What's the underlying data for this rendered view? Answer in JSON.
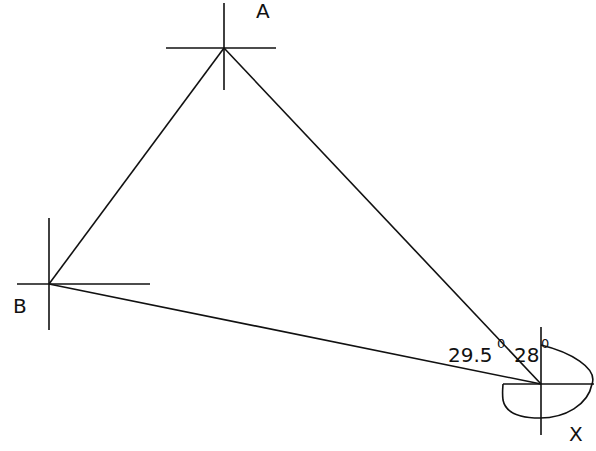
{
  "diagram": {
    "type": "bearing-triangle",
    "points": {
      "A": {
        "label": "A",
        "x": 224,
        "y": 48
      },
      "B": {
        "label": "B",
        "x": 49,
        "y": 284
      },
      "X": {
        "label": "X",
        "x": 541,
        "y": 384
      }
    },
    "edges": [
      {
        "from": "A",
        "to": "B"
      },
      {
        "from": "A",
        "to": "X"
      },
      {
        "from": "B",
        "to": "X"
      }
    ],
    "angles": [
      {
        "value": "29.5",
        "unit": "0",
        "at": "X",
        "between": [
          "XB",
          "XA"
        ]
      },
      {
        "value": "28",
        "unit": "0",
        "at": "X",
        "between": [
          "XA",
          "North"
        ]
      }
    ],
    "stroke_color": "#111111",
    "background": "#ffffff"
  }
}
